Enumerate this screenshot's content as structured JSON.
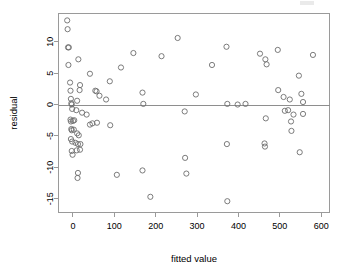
{
  "chart_data": {
    "type": "scatter",
    "title": "",
    "xlabel": "fitted value",
    "ylabel": "residual",
    "xlim": [
      -35,
      620
    ],
    "ylim": [
      -17.2,
      14.5
    ],
    "xticks": [
      0,
      100,
      200,
      300,
      400,
      500,
      600
    ],
    "xtick_labels": [
      "0",
      "100",
      "200",
      "300",
      "400",
      "500",
      "600"
    ],
    "yticks": [
      10,
      5,
      0,
      -5,
      -10,
      -15
    ],
    "ytick_labels": [
      "10",
      "5",
      "0",
      "-5",
      "-10",
      "-15"
    ],
    "grid": false,
    "legend": null,
    "reference_line": {
      "orientation": "horizontal",
      "y": 0
    },
    "marker": {
      "shape": "circle-open",
      "radius": 2.6,
      "color": "#6d6d6d"
    },
    "series": [
      {
        "name": "residuals",
        "points": [
          [
            -14,
            13.4
          ],
          [
            -13,
            12.0
          ],
          [
            -12,
            9.1
          ],
          [
            -10,
            9.1
          ],
          [
            -11,
            6.3
          ],
          [
            13,
            7.2
          ],
          [
            41,
            4.9
          ],
          [
            -7,
            3.5
          ],
          [
            17,
            3.1
          ],
          [
            -6,
            2.2
          ],
          [
            16,
            2.3
          ],
          [
            54,
            2.2
          ],
          [
            57,
            2.1
          ],
          [
            64,
            1.4
          ],
          [
            80,
            0.8
          ],
          [
            89,
            3.7
          ],
          [
            116,
            5.9
          ],
          [
            146,
            8.2
          ],
          [
            214,
            7.7
          ],
          [
            253,
            10.6
          ],
          [
            336,
            6.3
          ],
          [
            371,
            9.2
          ],
          [
            452,
            8.1
          ],
          [
            465,
            7.2
          ],
          [
            468,
            6.4
          ],
          [
            495,
            8.7
          ],
          [
            580,
            7.9
          ],
          [
            546,
            4.6
          ],
          [
            496,
            2.3
          ],
          [
            509,
            1.2
          ],
          [
            524,
            0.8
          ],
          [
            552,
            1.7
          ],
          [
            556,
            0.4
          ],
          [
            168,
            1.9
          ],
          [
            297,
            1.6
          ],
          [
            -5,
            0.9
          ],
          [
            -4,
            0.2
          ],
          [
            -3,
            0.0
          ],
          [
            10,
            0.6
          ],
          [
            170,
            0.1
          ],
          [
            373,
            0.1
          ],
          [
            398,
            0.0
          ],
          [
            417,
            0.1
          ],
          [
            -2,
            -0.7
          ],
          [
            8,
            -0.9
          ],
          [
            22,
            -1.3
          ],
          [
            33,
            -1.6
          ],
          [
            270,
            -1.1
          ],
          [
            512,
            -1.0
          ],
          [
            520,
            -0.9
          ],
          [
            533,
            -1.6
          ],
          [
            556,
            -1.5
          ],
          [
            -6,
            -2.4
          ],
          [
            -5,
            -2.7
          ],
          [
            0,
            -2.6
          ],
          [
            3,
            -2.5
          ],
          [
            41,
            -3.2
          ],
          [
            47,
            -3.0
          ],
          [
            58,
            -2.9
          ],
          [
            90,
            -3.3
          ],
          [
            527,
            -2.7
          ],
          [
            466,
            -2.2
          ],
          [
            -4,
            -3.9
          ],
          [
            -3,
            -4.1
          ],
          [
            2,
            -4.0
          ],
          [
            10,
            -4.6
          ],
          [
            14,
            -4.9
          ],
          [
            528,
            -4.2
          ],
          [
            -5,
            -5.5
          ],
          [
            -2,
            -5.9
          ],
          [
            6,
            -6.1
          ],
          [
            12,
            -6.3
          ],
          [
            18,
            -6.3
          ],
          [
            372,
            -6.3
          ],
          [
            463,
            -6.2
          ],
          [
            464,
            -6.7
          ],
          [
            -3,
            -7.4
          ],
          [
            9,
            -7.3
          ],
          [
            17,
            -7.2
          ],
          [
            -1,
            -8.0
          ],
          [
            548,
            -7.6
          ],
          [
            271,
            -8.5
          ],
          [
            12,
            -10.9
          ],
          [
            106,
            -11.2
          ],
          [
            168,
            -10.5
          ],
          [
            274,
            -11.0
          ],
          [
            11,
            -11.7
          ],
          [
            187,
            -14.7
          ],
          [
            373,
            -15.4
          ]
        ]
      }
    ]
  },
  "annotations": {
    "top_right_smudge": "artifact"
  }
}
